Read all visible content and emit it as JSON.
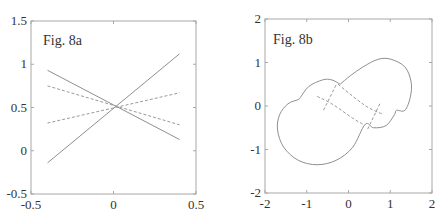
{
  "chart_data": [
    {
      "type": "line",
      "title": "Fig. 8a",
      "xlabel": "",
      "ylabel": "",
      "xlim": [
        -0.5,
        0.5
      ],
      "ylim": [
        -0.5,
        1.5
      ],
      "xticks": [
        -0.5,
        0,
        0.5
      ],
      "xtick_labels": [
        "-0.5",
        "0",
        "0.5"
      ],
      "yticks": [
        -0.5,
        0,
        0.5,
        1,
        1.5
      ],
      "ytick_labels": [
        "-0.5",
        "0",
        "0.5",
        "1",
        "1.5"
      ],
      "grid": false,
      "legend": null,
      "series": [
        {
          "name": "solid-descending",
          "style": "solid",
          "x": [
            -0.4,
            0.4
          ],
          "y": [
            0.93,
            0.13
          ]
        },
        {
          "name": "solid-ascending",
          "style": "solid",
          "x": [
            -0.4,
            0.4
          ],
          "y": [
            -0.14,
            1.12
          ]
        },
        {
          "name": "dashed-descending",
          "style": "dashed",
          "x": [
            -0.4,
            0.4
          ],
          "y": [
            0.75,
            0.3
          ]
        },
        {
          "name": "dashed-ascending",
          "style": "dashed",
          "x": [
            -0.4,
            0.4
          ],
          "y": [
            0.32,
            0.67
          ]
        }
      ]
    },
    {
      "type": "line",
      "title": "Fig. 8b",
      "xlabel": "",
      "ylabel": "",
      "xlim": [
        -2,
        2
      ],
      "ylim": [
        -2,
        2
      ],
      "xticks": [
        -2,
        -1,
        0,
        1,
        2
      ],
      "xtick_labels": [
        "-2",
        "-1",
        "0",
        "1",
        "2"
      ],
      "yticks": [
        -2,
        -1,
        0,
        1,
        2
      ],
      "ytick_labels": [
        "-2",
        "-1",
        "0",
        "1",
        "2"
      ],
      "grid": false,
      "legend": null,
      "series": [
        {
          "name": "closed-contour",
          "style": "solid",
          "points": [
            [
              -0.2,
              0.5
            ],
            [
              -0.4,
              0.6
            ],
            [
              -0.62,
              0.6
            ],
            [
              -0.95,
              0.45
            ],
            [
              -1.15,
              0.2
            ],
            [
              -1.2,
              0.15
            ],
            [
              -1.45,
              0.05
            ],
            [
              -1.65,
              -0.2
            ],
            [
              -1.7,
              -0.55
            ],
            [
              -1.55,
              -0.95
            ],
            [
              -1.2,
              -1.25
            ],
            [
              -0.75,
              -1.35
            ],
            [
              -0.3,
              -1.25
            ],
            [
              0.1,
              -0.95
            ],
            [
              0.4,
              -0.42
            ],
            [
              0.6,
              -0.5
            ],
            [
              0.9,
              -0.45
            ],
            [
              1.1,
              -0.2
            ],
            [
              1.15,
              -0.1
            ],
            [
              1.35,
              -0.1
            ],
            [
              1.48,
              0.2
            ],
            [
              1.5,
              0.55
            ],
            [
              1.35,
              0.9
            ],
            [
              1.0,
              1.08
            ],
            [
              0.7,
              1.07
            ],
            [
              0.35,
              0.9
            ],
            [
              0.05,
              0.7
            ],
            [
              -0.2,
              0.5
            ]
          ]
        },
        {
          "name": "dashed-curve-upper",
          "style": "dashed",
          "points": [
            [
              -0.25,
              0.5
            ],
            [
              0.2,
              0.15
            ],
            [
              0.5,
              -0.05
            ],
            [
              0.8,
              -0.18
            ]
          ]
        },
        {
          "name": "dashed-curve-lower",
          "style": "dashed",
          "points": [
            [
              -0.75,
              0.22
            ],
            [
              -0.4,
              0.05
            ],
            [
              0.1,
              -0.28
            ],
            [
              0.35,
              -0.42
            ]
          ]
        },
        {
          "name": "dashed-cross-left",
          "style": "dashed",
          "points": [
            [
              -0.3,
              0.48
            ],
            [
              -0.6,
              -0.1
            ]
          ]
        },
        {
          "name": "dashed-cross-right",
          "style": "dashed",
          "points": [
            [
              0.75,
              0.05
            ],
            [
              0.45,
              -0.55
            ]
          ]
        }
      ]
    }
  ]
}
